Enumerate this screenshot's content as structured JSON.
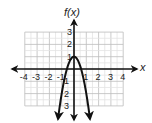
{
  "chart_data": {
    "type": "line",
    "title": "",
    "xlabel": "x",
    "ylabel": "f(x)",
    "function": "f(x) = -3x^2 + 1",
    "xlim": [
      -4,
      4
    ],
    "ylim": [
      -3,
      3
    ],
    "grid": true,
    "x_ticks": [
      "-4",
      "-3",
      "-2",
      "-1",
      "1",
      "2",
      "3",
      "4"
    ],
    "y_ticks": [
      "3",
      "2",
      "1",
      "-1",
      "-2",
      "-3"
    ],
    "series": [
      {
        "name": "f(x)",
        "x": [
          -1.3,
          -1,
          -0.5,
          0,
          0.5,
          1,
          1.3
        ],
        "y": [
          -4.07,
          -2,
          0.25,
          1,
          0.25,
          -2,
          -4.07
        ],
        "vertex": [
          0,
          1
        ],
        "opens": "down",
        "arrows_at_ends": true
      }
    ]
  },
  "labels": {
    "x_axis": "x",
    "y_axis": "f(x)"
  },
  "colors": {
    "grid": "#c8c8c8",
    "axis": "#111111",
    "curve": "#111111"
  }
}
